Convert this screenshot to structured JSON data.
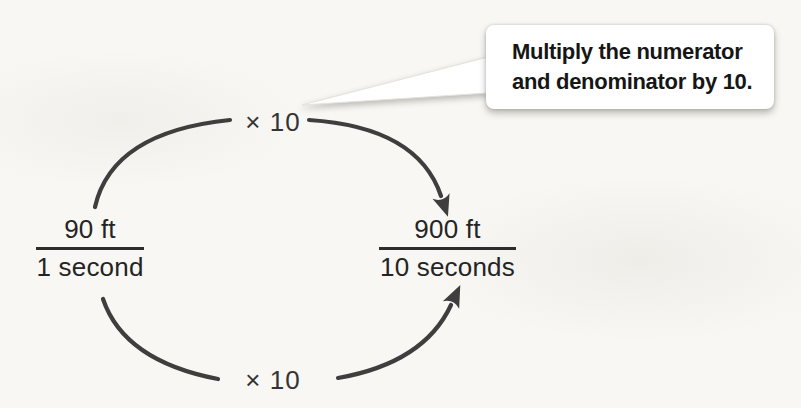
{
  "figure": {
    "left_fraction": {
      "numerator": "90 ft",
      "denominator": "1 second"
    },
    "right_fraction": {
      "numerator": "900 ft",
      "denominator": "10 seconds"
    },
    "top_operation": "× 10",
    "bottom_operation": "× 10",
    "callout": {
      "line1": "Multiply the numerator",
      "line2": "and denominator by 10."
    },
    "colors": {
      "arrow": "#3e3e3e",
      "text": "#1f1f1f",
      "callout_background": "#ffffff",
      "page_background": "#f8f7f3"
    }
  }
}
